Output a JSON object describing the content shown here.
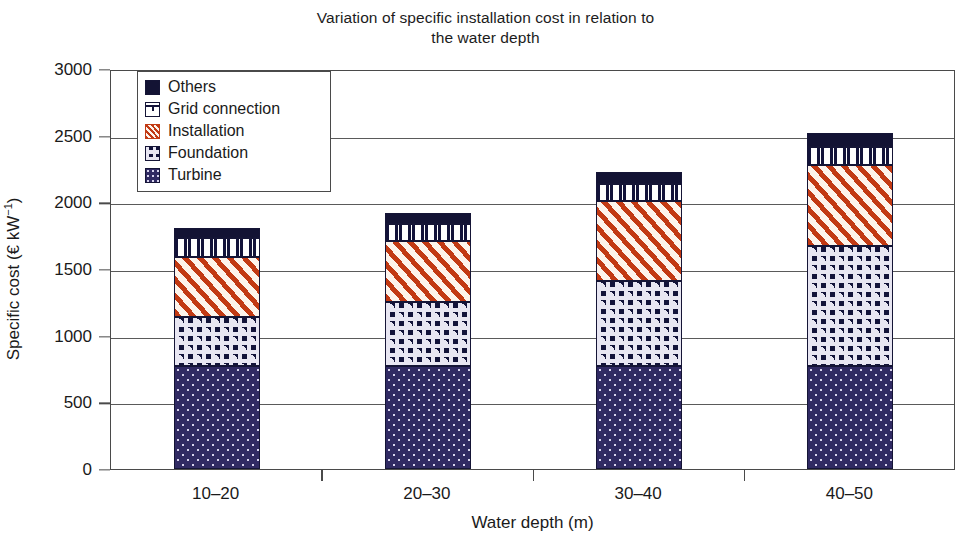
{
  "chart_data": {
    "type": "bar",
    "stacked": true,
    "title": "Variation of specific installation cost in relation to the water depth",
    "title_line1": "Variation of specific installation cost in relation to",
    "title_line2": "the water depth",
    "xlabel": "Water depth (m)",
    "ylabel_prefix": "Specific cost (€ kW",
    "ylabel_sup": "−1",
    "ylabel_suffix": ")",
    "ylabel": "Specific cost (€ kW−1)",
    "categories": [
      "10–20",
      "20–30",
      "30–40",
      "40–50"
    ],
    "ylim": [
      0,
      3000
    ],
    "yticks": [
      0,
      500,
      1000,
      1500,
      2000,
      2500,
      3000
    ],
    "ytick_labels": [
      "0",
      "500",
      "1000",
      "1500",
      "2000",
      "2500",
      "3000"
    ],
    "grid": true,
    "legend_position": "top-left-inside",
    "series": [
      {
        "name": "Turbine",
        "pattern": "fill-turbine",
        "swatch": "sw-turbine",
        "color": "#302a63",
        "values": [
          775,
          775,
          775,
          775
        ]
      },
      {
        "name": "Foundation",
        "pattern": "fill-foundation",
        "swatch": "sw-foundation",
        "color": "#13133a",
        "values": [
          365,
          475,
          635,
          900
        ]
      },
      {
        "name": "Installation",
        "pattern": "fill-install",
        "swatch": "sw-install",
        "color": "#c23a14",
        "values": [
          450,
          460,
          600,
          605
        ]
      },
      {
        "name": "Grid connection",
        "pattern": "fill-grid",
        "swatch": "sw-grid",
        "color": "#ffffff",
        "values": [
          145,
          130,
          130,
          135
        ]
      },
      {
        "name": "Others",
        "pattern": "fill-others",
        "swatch": "fill-others",
        "color": "#131334",
        "values": [
          75,
          80,
          90,
          105
        ]
      }
    ],
    "totals": [
      1810,
      1920,
      2230,
      2520
    ],
    "legend_order": [
      "Others",
      "Grid connection",
      "Installation",
      "Foundation",
      "Turbine"
    ]
  }
}
